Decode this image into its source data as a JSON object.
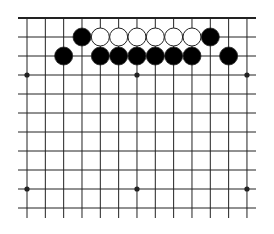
{
  "board": {
    "title": "Go board diagram (top edge)",
    "columns": 13,
    "rows_visible": 11,
    "top_edge": true,
    "grid": {
      "x0": 27,
      "dx": 18.33,
      "y0": 18,
      "dy": 19,
      "h_line_left": 18,
      "h_line_right": 256,
      "v_line_bottom": 218
    },
    "colors": {
      "line": "#222222",
      "black_stone": "#000000",
      "white_stone": "#ffffff",
      "stone_outline": "#222222",
      "background": "#ffffff"
    },
    "star_points": [
      {
        "col": 0,
        "row": 3
      },
      {
        "col": 6,
        "row": 3
      },
      {
        "col": 12,
        "row": 3
      },
      {
        "col": 0,
        "row": 9
      },
      {
        "col": 6,
        "row": 9
      },
      {
        "col": 12,
        "row": 9
      }
    ],
    "stones": [
      {
        "color": "black",
        "col": 3,
        "row": 1
      },
      {
        "color": "white",
        "col": 4,
        "row": 1
      },
      {
        "color": "white",
        "col": 5,
        "row": 1
      },
      {
        "color": "white",
        "col": 6,
        "row": 1
      },
      {
        "color": "white",
        "col": 7,
        "row": 1
      },
      {
        "color": "white",
        "col": 8,
        "row": 1
      },
      {
        "color": "white",
        "col": 9,
        "row": 1
      },
      {
        "color": "black",
        "col": 10,
        "row": 1
      },
      {
        "color": "black",
        "col": 2,
        "row": 2
      },
      {
        "color": "black",
        "col": 4,
        "row": 2
      },
      {
        "color": "black",
        "col": 5,
        "row": 2
      },
      {
        "color": "black",
        "col": 6,
        "row": 2
      },
      {
        "color": "black",
        "col": 7,
        "row": 2
      },
      {
        "color": "black",
        "col": 8,
        "row": 2
      },
      {
        "color": "black",
        "col": 9,
        "row": 2
      },
      {
        "color": "black",
        "col": 11,
        "row": 2
      }
    ]
  }
}
